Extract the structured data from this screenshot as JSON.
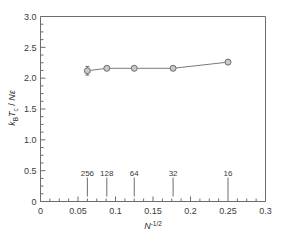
{
  "chart_data": {
    "type": "scatter",
    "title": "",
    "xlabel": "N^-1/2",
    "xlabel_parts": {
      "base": "N",
      "exponent": "-1/2"
    },
    "ylabel": "kBTc / Nε",
    "ylabel_parts": {
      "k": "k",
      "k_sub": "B",
      "T": "T",
      "T_sub": "c",
      "slash": " / ",
      "N": "N",
      "eps": "ε"
    },
    "xlim": [
      0,
      0.3
    ],
    "ylim": [
      0,
      3.0
    ],
    "grid": false,
    "legend": null,
    "x_ticks": [
      "0",
      "0.05",
      "0.1",
      "0.15",
      "0.2",
      "0.25",
      "0.3"
    ],
    "x_tick_values": [
      0,
      0.05,
      0.1,
      0.15,
      0.2,
      0.25,
      0.3
    ],
    "y_ticks": [
      "0",
      "0.5",
      "1.0",
      "1.5",
      "2.0",
      "2.5",
      "3.0"
    ],
    "y_tick_values": [
      0,
      0.5,
      1.0,
      1.5,
      2.0,
      2.5,
      3.0
    ],
    "x_minor_step": 0.0125,
    "y_minor_step": 0.125,
    "x": [
      0.0625,
      0.0884,
      0.125,
      0.1768,
      0.25
    ],
    "values": [
      2.12,
      2.16,
      2.16,
      2.16,
      2.26
    ],
    "yerr": [
      0.07,
      0.02,
      0.02,
      0.02,
      0.03
    ],
    "marker": "circle",
    "marker_size": 4,
    "inner_labels": [
      "256",
      "128",
      "64",
      "32",
      "16"
    ],
    "inner_label_x": [
      0.0625,
      0.0884,
      0.125,
      0.1768,
      0.25
    ],
    "inner_label_y": 0.42,
    "series_name": "kBTc/Nepsilon vs N^-1/2"
  },
  "colors": {
    "axis": "#6d6d6d",
    "line": "#7a7a7a",
    "marker_fill": "#c9c9c9",
    "marker_edge": "#6d6d6d",
    "text": "#2b2b2b",
    "background": "#ffffff"
  }
}
